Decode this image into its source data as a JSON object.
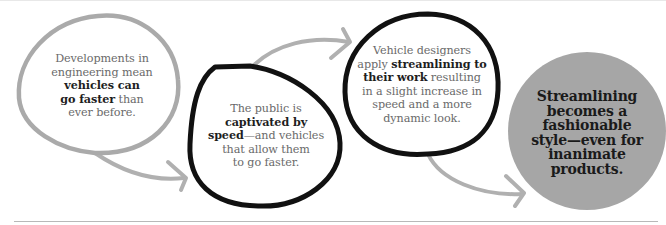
{
  "diagram": {
    "type": "flow",
    "colors": {
      "light_bubble_outline": "#aaaaaa",
      "dark_bubble_outline": "#111111",
      "final_circle_fill": "#a6a6a6",
      "arrow": "#b0b0b0",
      "body_text": "#6a6a6a",
      "bold_text": "#1e1e1e"
    },
    "steps": [
      {
        "id": "step-1",
        "style": "light-outline-bubble",
        "lines": [
          {
            "pre": "Developments in",
            "bold": "",
            "post": ""
          },
          {
            "pre": "engineering mean",
            "bold": "",
            "post": ""
          },
          {
            "pre": "",
            "bold": "vehicles can",
            "post": ""
          },
          {
            "pre": "",
            "bold": "go faster",
            "post": " than"
          },
          {
            "pre": "ever before.",
            "bold": "",
            "post": ""
          }
        ]
      },
      {
        "id": "step-2",
        "style": "dark-outline-bubble",
        "lines": [
          {
            "pre": "The public is",
            "bold": "",
            "post": ""
          },
          {
            "pre": "",
            "bold": "captivated by",
            "post": ""
          },
          {
            "pre": "",
            "bold": "speed",
            "post": "—and vehicles"
          },
          {
            "pre": "that allow them",
            "bold": "",
            "post": ""
          },
          {
            "pre": "to go faster.",
            "bold": "",
            "post": ""
          }
        ]
      },
      {
        "id": "step-3",
        "style": "dark-outline-bubble",
        "lines": [
          {
            "pre": "Vehicle designers",
            "bold": "",
            "post": ""
          },
          {
            "pre": "apply ",
            "bold": "streamlining to",
            "post": ""
          },
          {
            "pre": "",
            "bold": "their work",
            "post": " resulting"
          },
          {
            "pre": "in a slight increase in",
            "bold": "",
            "post": ""
          },
          {
            "pre": "speed and a more",
            "bold": "",
            "post": ""
          },
          {
            "pre": "dynamic look.",
            "bold": "",
            "post": ""
          }
        ]
      },
      {
        "id": "step-4",
        "style": "filled-gray-circle",
        "lines": [
          "Streamlining",
          "becomes a",
          "fashionable",
          "style—even for",
          "inanimate",
          "products."
        ]
      }
    ],
    "arrows": [
      {
        "from": "step-1",
        "to": "step-2"
      },
      {
        "from": "step-2",
        "to": "step-3"
      },
      {
        "from": "step-3",
        "to": "step-4"
      }
    ]
  }
}
